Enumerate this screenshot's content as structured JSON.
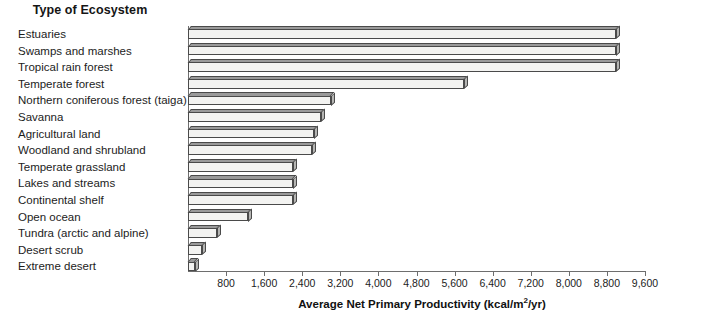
{
  "chart_data": {
    "type": "bar",
    "orientation": "horizontal",
    "title": "Type of Ecosystem",
    "xlabel": "Average Net Primary Productivity (kcal/m²/yr)",
    "ylabel": "Type of Ecosystem",
    "xlim": [
      0,
      9600
    ],
    "xticks": [
      800,
      1600,
      2400,
      3200,
      4000,
      4800,
      5600,
      6400,
      7200,
      8000,
      8800,
      9600
    ],
    "xtick_labels": [
      "800",
      "1,600",
      "2,400",
      "3,200",
      "4,000",
      "4,800",
      "5,600",
      "6,400",
      "7,200",
      "8,000",
      "8,800",
      "9,600"
    ],
    "grid": false,
    "legend": false,
    "categories": [
      "Estuaries",
      "Swamps and marshes",
      "Tropical rain forest",
      "Temperate forest",
      "Northern coniferous forest (taiga)",
      "Savanna",
      "Agricultural land",
      "Woodland and shrubland",
      "Temperate grassland",
      "Lakes and streams",
      "Continental shelf",
      "Open ocean",
      "Tundra (arctic and alpine)",
      "Desert scrub",
      "Extreme desert"
    ],
    "values": [
      9000,
      9000,
      9000,
      5800,
      3000,
      2800,
      2650,
      2600,
      2200,
      2200,
      2200,
      1250,
      600,
      300,
      150
    ]
  },
  "axis_title": {
    "x_prefix": "Average Net Primary Productivity (kcal/m",
    "x_sup": "2",
    "x_suffix": "/yr)"
  }
}
